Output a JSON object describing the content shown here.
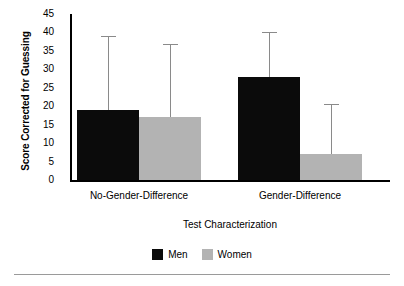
{
  "chart_data": {
    "type": "bar",
    "title": "",
    "xlabel": "Test Characterization",
    "ylabel": "Score Corrected for Guessing",
    "categories": [
      "No-Gender-Difference",
      "Gender-Difference"
    ],
    "series": [
      {
        "name": "Men",
        "color": "#0b0b0b",
        "values": [
          19,
          28
        ],
        "error_upper": [
          39,
          40
        ]
      },
      {
        "name": "Women",
        "color": "#b3b3b3",
        "values": [
          17,
          7
        ],
        "error_upper": [
          37,
          20.5
        ]
      }
    ],
    "ylim": [
      0,
      45
    ],
    "yticks": [
      0,
      5,
      10,
      15,
      20,
      25,
      30,
      35,
      40,
      45
    ],
    "ytick_labels": [
      "0",
      "5",
      "10",
      "15",
      "20",
      "25",
      "30",
      "35",
      "40",
      "45"
    ],
    "grid": false,
    "legend_position": "bottom",
    "legend_entries": [
      "Men",
      "Women"
    ],
    "error_bar_style": "upper-only-whisker-with-cap",
    "axis_color": "#000000",
    "error_bar_color": "#8a8a8a"
  },
  "figure": {
    "footer_rule_color": "#9a9a9a"
  }
}
